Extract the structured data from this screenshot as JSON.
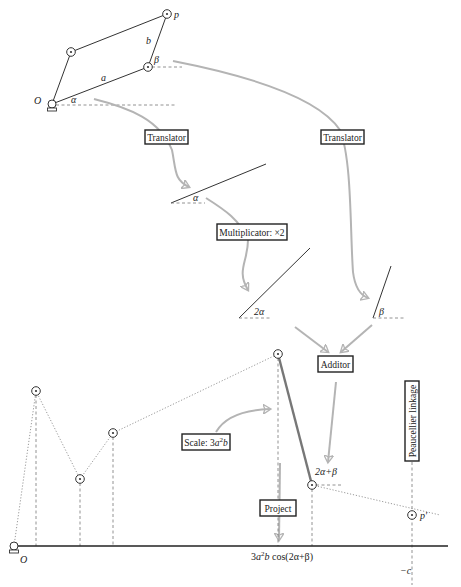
{
  "diagram": {
    "colors": {
      "ink": "#222222",
      "arrow": "#b4b4b4",
      "thick_bar": "#777777",
      "dashed": "#777777",
      "dotted": "#9a9a9a"
    },
    "top_linkage": {
      "origin_label": "O",
      "p_label": "p",
      "a_label": "a",
      "b_label": "b",
      "alpha_label": "α",
      "beta_label": "β"
    },
    "boxes": {
      "translator_1": "Translator",
      "translator_2": "Translator",
      "multiplicator": "Multiplicator: ×2",
      "additor": "Additor",
      "scale": "Scale: 3a²b",
      "scale_prefix": "Scale: 3",
      "scale_a": "a",
      "scale_exp": "2",
      "scale_b": "b",
      "project": "Project",
      "peaucellier": "Peaucellier linkage"
    },
    "angles": {
      "alpha": "α",
      "two_alpha": "2α",
      "beta": "β",
      "sum": "2α+β"
    },
    "bottom": {
      "origin_label": "O",
      "p_prime_label": "p′",
      "neg_c_label": "−c",
      "x_axis_label": "3a²b cos(2α+β)",
      "x_label_3": "3",
      "x_label_a": "a",
      "x_label_exp": "2",
      "x_label_b": "b",
      "x_label_rest": " cos(2α+β)"
    }
  }
}
